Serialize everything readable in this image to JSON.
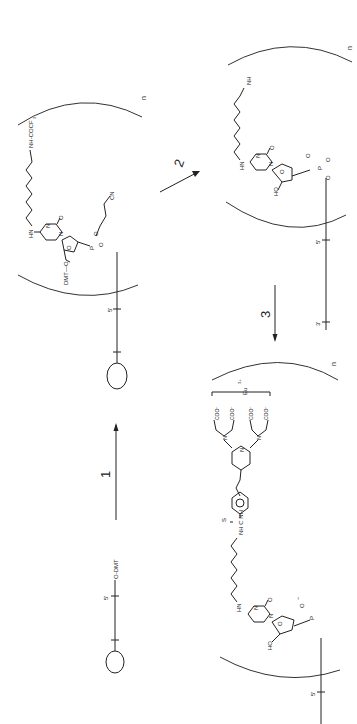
{
  "scheme": {
    "orientation": "rotated-90-ccw",
    "steps": [
      {
        "label": "1",
        "description": "coupling of protected amino-modified cytidine phosphoramidite"
      },
      {
        "label": "2",
        "description": "deprotection"
      },
      {
        "label": "3",
        "description": "labeling with europium chelate"
      }
    ],
    "repeat_label": "n",
    "structures": {
      "start": {
        "five_prime": "5'",
        "protect": "O-DMT"
      },
      "intermediate1": {
        "amine_protect": "NH-COCF",
        "amine_sub": "3",
        "hn": "HN",
        "n1": "N",
        "n2": "N",
        "o_carbonyl": "O",
        "ring_o": "O",
        "dmt": "DMT—O",
        "phosphite": "P",
        "o1": "O",
        "o2": "O",
        "o3": "O",
        "cyanoethyl": "CN",
        "five_prime": "5'"
      },
      "intermediate2": {
        "amine": "NH",
        "amine_sub": "2",
        "hn": "HN",
        "n1": "N",
        "n2": "N",
        "o_carbonyl": "O",
        "ring_o": "O",
        "ho": "HO",
        "phosphate": "P",
        "o_minus": "O",
        "charge": "−",
        "o_double": "O",
        "o_link": "O",
        "o_ester": "O",
        "five_prime": "5'",
        "three_prime": "3'"
      },
      "product": {
        "thiourea": "NH C NH",
        "sulfur": "S",
        "hn": "HN",
        "n1": "N",
        "n2": "N",
        "o_carbonyl": "O",
        "ring_o": "O",
        "ho": "HO",
        "phosphate": "P",
        "o_minus": "O",
        "charge": "−",
        "coo": [
          "COO⁻",
          "COO⁻",
          "COO⁻",
          "COO⁻"
        ],
        "n_amine": "N",
        "n_pyr": "N",
        "europium": "Eu",
        "eu_charge": "3+",
        "five_prime": "5'"
      }
    }
  }
}
